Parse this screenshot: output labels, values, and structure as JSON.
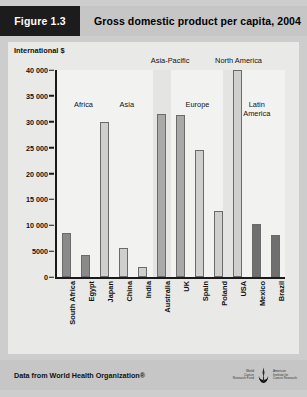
{
  "header": {
    "figure_label": "Figure 1.3",
    "title": "Gross domestic product per capita, 2004"
  },
  "footer": {
    "source": "Data from World Health Organization®",
    "logo_left": "World\nCancer\nResearch Fund",
    "logo_right": "American\nInstitute for\nCancer Research",
    "emblem_name": "wcrf-aicr-emblem"
  },
  "chart_data": {
    "type": "bar",
    "title": "Gross domestic product per capita, 2004",
    "xlabel": "",
    "ylabel": "International $",
    "ylim": [
      0,
      40000
    ],
    "yticks": [
      0,
      5000,
      10000,
      15000,
      20000,
      25000,
      30000,
      35000,
      40000
    ],
    "ytick_labels": [
      "0",
      "5000",
      "10 000",
      "15 000",
      "20 000",
      "25 000",
      "30 000",
      "35 000",
      "40 000"
    ],
    "grid": false,
    "legend": "none",
    "categories": [
      "South Africa",
      "Egypt",
      "Japan",
      "China",
      "India",
      "Australia",
      "UK",
      "Spain",
      "Poland",
      "USA",
      "Mexico",
      "Brazil"
    ],
    "values": [
      8500,
      4200,
      30000,
      5600,
      1900,
      31500,
      31400,
      24500,
      12700,
      40000,
      10200,
      8100
    ],
    "bar_colors": [
      "#8a8a8a",
      "#8a8a8a",
      "#cfcfcd",
      "#cfcfcd",
      "#cfcfcd",
      "#a9a9a9",
      "#a9a9a9",
      "#cfcfcd",
      "#cfcfcd",
      "#cfcfcd",
      "#6f6f6f",
      "#6f6f6f"
    ],
    "groups": [
      {
        "name": "Africa",
        "countries": [
          "South Africa",
          "Egypt"
        ],
        "position": "inside"
      },
      {
        "name": "Asia",
        "countries": [
          "Japan",
          "China",
          "India"
        ],
        "position": "inside"
      },
      {
        "name": "Asia-Pacific",
        "countries": [
          "Australia"
        ],
        "position": "above"
      },
      {
        "name": "Europe",
        "countries": [
          "UK",
          "Spain",
          "Poland"
        ],
        "position": "inside"
      },
      {
        "name": "North America",
        "countries": [
          "USA"
        ],
        "position": "above"
      },
      {
        "name": "Latin\nAmerica",
        "countries": [
          "Mexico",
          "Brazil"
        ],
        "position": "inside"
      }
    ],
    "group_labels_above": [
      {
        "text": "Asia-Pacific",
        "x_pct": 50.5
      },
      {
        "text": "North America",
        "x_pct": 80.5
      }
    ],
    "group_labels_inside": [
      {
        "text": "Africa",
        "x_pct": 12.5,
        "y_pct": 15
      },
      {
        "text": "Asia",
        "x_pct": 31.5,
        "y_pct": 15
      },
      {
        "text": "Europe",
        "x_pct": 62.5,
        "y_pct": 15
      },
      {
        "text": "Latin\nAmerica",
        "x_pct": 88.5,
        "y_pct": 15
      }
    ],
    "shaded_bands": [
      {
        "x_pct": 42.0,
        "w_pct": 8.0
      },
      {
        "x_pct": 73.0,
        "w_pct": 7.5
      }
    ]
  }
}
